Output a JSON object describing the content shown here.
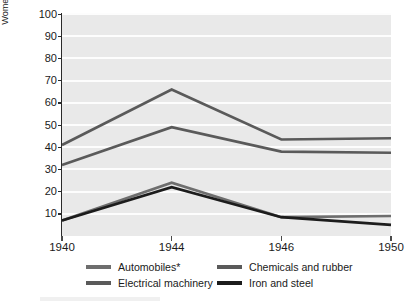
{
  "chart_data": {
    "type": "line",
    "title": "",
    "subtitle": "",
    "xlabel": "",
    "ylabel": "Women as a percentage of all production workers",
    "x": [
      "1940",
      "1944",
      "1946",
      "1950"
    ],
    "categories": [
      "1940",
      "1944",
      "1946",
      "1950"
    ],
    "xtick_labels": [
      "1940",
      "1944",
      "1946",
      "1950"
    ],
    "ytick_labels": [
      "100",
      "90",
      "80",
      "70",
      "60",
      "50",
      "40",
      "30",
      "20",
      "10"
    ],
    "ylim": [
      0,
      100
    ],
    "ytick_step": 10,
    "grid": true,
    "grid_color": "#fdfdfd",
    "plot_background": "#e9e9e9",
    "legend_position": "bottom",
    "series": [
      {
        "name": "Automobiles*",
        "color": "#6e6e6e",
        "values": [
          7,
          24,
          8.5,
          9
        ]
      },
      {
        "name": "Electrical machinery",
        "color": "#5a5a5a",
        "values": [
          32,
          49,
          38,
          37.5
        ]
      },
      {
        "name": "Chemicals and rubber",
        "color": "#5a5a5a",
        "values": [
          41,
          66,
          43.5,
          44
        ]
      },
      {
        "name": "Iron and steel",
        "color": "#1c1c1c",
        "values": [
          7,
          22,
          8.5,
          5
        ]
      }
    ]
  },
  "axis": {
    "y_title": "Women as a percentage of all production workers"
  },
  "legend": {
    "items": [
      {
        "label": "Automobiles*",
        "color": "#6e6e6e"
      },
      {
        "label": "Electrical machinery",
        "color": "#5a5a5a"
      },
      {
        "label": "Chemicals and rubber",
        "color": "#5a5a5a"
      },
      {
        "label": "Iron and steel",
        "color": "#1c1c1c"
      }
    ]
  }
}
